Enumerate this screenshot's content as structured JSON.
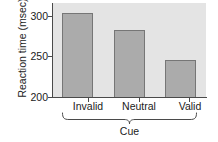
{
  "chart_data": {
    "type": "bar",
    "title": "",
    "subtitle": "",
    "xlabel": "Cue",
    "ylabel": "Reaction time (msec)",
    "categories": [
      "Invalid",
      "Neutral",
      "Valid"
    ],
    "values": [
      304,
      283,
      246
    ],
    "ylim": [
      200,
      310
    ],
    "y_ticks": [
      "300",
      "250",
      "200"
    ],
    "y_tick_values": [
      300,
      250,
      200
    ],
    "grid": false,
    "legend": false,
    "bar_color": "#ababab",
    "bar_edge_color": "#767676",
    "plot_background": "#e4e4e4",
    "axis_color": "#4a4a4a",
    "annotations": {
      "group_bracket": "Cue"
    }
  },
  "axis": {
    "y_label": "Reaction time (msec)",
    "x_group_label": "Cue",
    "tick_300": "300",
    "tick_250": "250",
    "tick_200": "200"
  },
  "categories": {
    "invalid": "Invalid",
    "neutral": "Neutral",
    "valid": "Valid"
  }
}
